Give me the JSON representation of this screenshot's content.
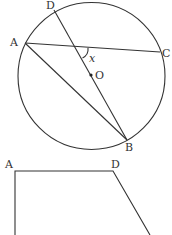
{
  "figure1": {
    "type": "circle-with-chords",
    "circle": {
      "cx": 91.5,
      "cy": 76,
      "r": 73.5
    },
    "center_label": "O",
    "points": {
      "A": {
        "label": "A",
        "x": 25,
        "y": 43
      },
      "C": {
        "label": "C",
        "x": 160,
        "y": 52
      },
      "D": {
        "label": "D",
        "x": 54,
        "y": 10
      },
      "B": {
        "label": "B",
        "x": 127,
        "y": 140
      }
    },
    "segments": [
      "AC",
      "DB",
      "AB"
    ],
    "angle_label": "x"
  },
  "figure2": {
    "type": "quadrilateral-partial",
    "points": {
      "A": {
        "label": "A",
        "x": 15,
        "y": 171
      },
      "D": {
        "label": "D",
        "x": 113,
        "y": 171
      }
    }
  }
}
